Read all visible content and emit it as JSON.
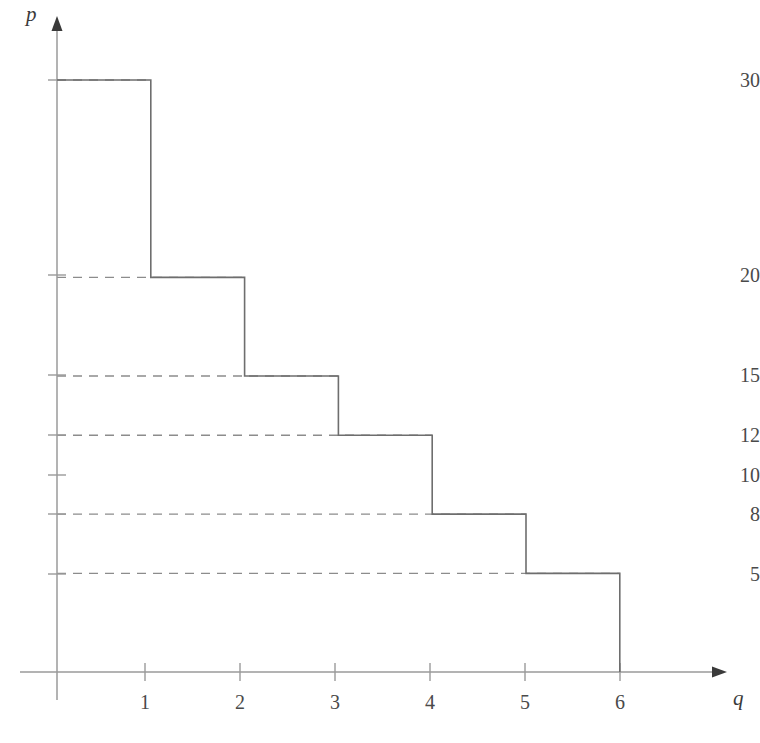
{
  "chart_data": {
    "type": "bar",
    "title": "",
    "subtitle": "",
    "xlabel": "q",
    "ylabel": "p",
    "categories": [
      "1",
      "2",
      "3",
      "4",
      "5",
      "6"
    ],
    "values": [
      30,
      20,
      15,
      12,
      8,
      5
    ],
    "x": [
      0,
      1,
      2,
      3,
      4,
      5,
      6
    ],
    "steps": [
      {
        "q_start": 0,
        "q_end": 1,
        "p": 30
      },
      {
        "q_start": 1,
        "q_end": 2,
        "p": 20
      },
      {
        "q_start": 2,
        "q_end": 3,
        "p": 15
      },
      {
        "q_start": 3,
        "q_end": 4,
        "p": 12
      },
      {
        "q_start": 4,
        "q_end": 5,
        "p": 8
      },
      {
        "q_start": 5,
        "q_end": 6,
        "p": 5
      }
    ],
    "xlim": [
      0,
      7
    ],
    "ylim": [
      0,
      33
    ],
    "xticks": [
      1,
      2,
      3,
      4,
      5,
      6
    ],
    "xtick_labels": [
      "1",
      "2",
      "3",
      "4",
      "5",
      "6"
    ],
    "yticks": [
      30,
      20,
      15,
      12,
      10,
      8,
      5
    ],
    "ytick_labels": [
      "30",
      "20",
      "15",
      "12",
      "10",
      "8",
      "5"
    ],
    "guide_lines": [
      30,
      20,
      15,
      12,
      8,
      5
    ],
    "ytick_without_guide": [
      10
    ],
    "grid": false,
    "legend": null,
    "annotations": [],
    "axis_arrows": true,
    "line_color": "#6e6e6e",
    "dash_color": "#8c8c8c",
    "axis_color": "#9a9a9a",
    "text_color": "#4a4a4a",
    "background": "#ffffff"
  },
  "axes": {
    "vertical_label": "p",
    "horizontal_label": "q"
  },
  "ytick_labels": {
    "t0": "30",
    "t1": "20",
    "t2": "15",
    "t3": "12",
    "t4": "10",
    "t5": "8",
    "t6": "5"
  },
  "xtick_labels": {
    "t0": "1",
    "t1": "2",
    "t2": "3",
    "t3": "4",
    "t4": "5",
    "t5": "6"
  }
}
